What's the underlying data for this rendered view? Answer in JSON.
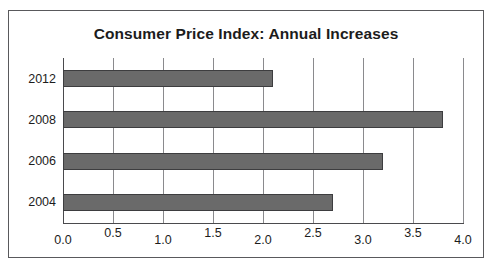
{
  "chart_data": {
    "type": "bar",
    "orientation": "horizontal",
    "title": "Consumer Price Index: Annual Increases",
    "xlabel": "",
    "ylabel": "",
    "categories": [
      "2012",
      "2008",
      "2006",
      "2004"
    ],
    "values": [
      2.1,
      3.8,
      3.2,
      2.7
    ],
    "xlim": [
      0.0,
      4.0
    ],
    "xticks": [
      "0.0",
      "0.5",
      "1.0",
      "1.5",
      "2.0",
      "2.5",
      "3.0",
      "3.5",
      "4.0"
    ],
    "xtick_values": [
      0.0,
      0.5,
      1.0,
      1.5,
      2.0,
      2.5,
      3.0,
      3.5,
      4.0
    ],
    "grid": "vertical",
    "legend": "none",
    "bar_color": "#6a6a6a",
    "bar_outline_color": "#3d3d3f",
    "gridline_color": "#8a8a8d",
    "axis_color": "#4a4a4d",
    "background_color": "#ffffff",
    "frame_color": "#59595c",
    "title_color": "#1c1c1c",
    "series": [
      {
        "name": "Annual Increase",
        "values": [
          2.1,
          3.8,
          3.2,
          2.7
        ]
      }
    ]
  }
}
